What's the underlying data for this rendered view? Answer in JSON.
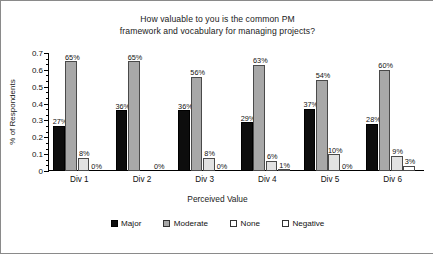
{
  "chart_data": {
    "type": "bar",
    "title": "How valuable to you is the common PM framework and vocabulary for managing projects?",
    "title_lines": [
      "How valuable to you is the common PM",
      "framework and vocabulary for managing projects?"
    ],
    "xlabel": "Perceived Value",
    "ylabel": "% of Respondents",
    "categories": [
      "Div 1",
      "Div 2",
      "Div 3",
      "Div 4",
      "Div 5",
      "Div 6"
    ],
    "ylim": [
      0,
      0.7
    ],
    "ytick_labels": [
      "0",
      "0.1",
      "0.2",
      "0.3",
      "0.4",
      "0.5",
      "0.6",
      "0.7"
    ],
    "ytick_values": [
      0,
      0.1,
      0.2,
      0.3,
      0.4,
      0.5,
      0.6,
      0.7
    ],
    "grid": false,
    "legend_position": "bottom",
    "series": [
      {
        "name": "Major",
        "color": "#0d0d0d",
        "values": [
          0.27,
          0.36,
          0.36,
          0.29,
          0.37,
          0.28
        ],
        "labels": [
          "27%",
          "36%",
          "36%",
          "29%",
          "37%",
          "28%"
        ]
      },
      {
        "name": "Moderate",
        "color": "#a8a8a8",
        "values": [
          0.65,
          0.65,
          0.56,
          0.63,
          0.54,
          0.6
        ],
        "labels": [
          "65%",
          "65%",
          "56%",
          "63%",
          "54%",
          "60%"
        ]
      },
      {
        "name": "None",
        "color": "#e2e2e2",
        "values": [
          0.08,
          0.0,
          0.08,
          0.06,
          0.1,
          0.09
        ],
        "labels": [
          "8%",
          "",
          "8%",
          "6%",
          "10%",
          "9%"
        ]
      },
      {
        "name": "Negative",
        "color": "#ffffff",
        "values": [
          0.0,
          0.0,
          0.0,
          0.01,
          0.0,
          0.03
        ],
        "labels": [
          "0%",
          "0%",
          "0%",
          "1%",
          "0%",
          "3%"
        ]
      }
    ]
  }
}
